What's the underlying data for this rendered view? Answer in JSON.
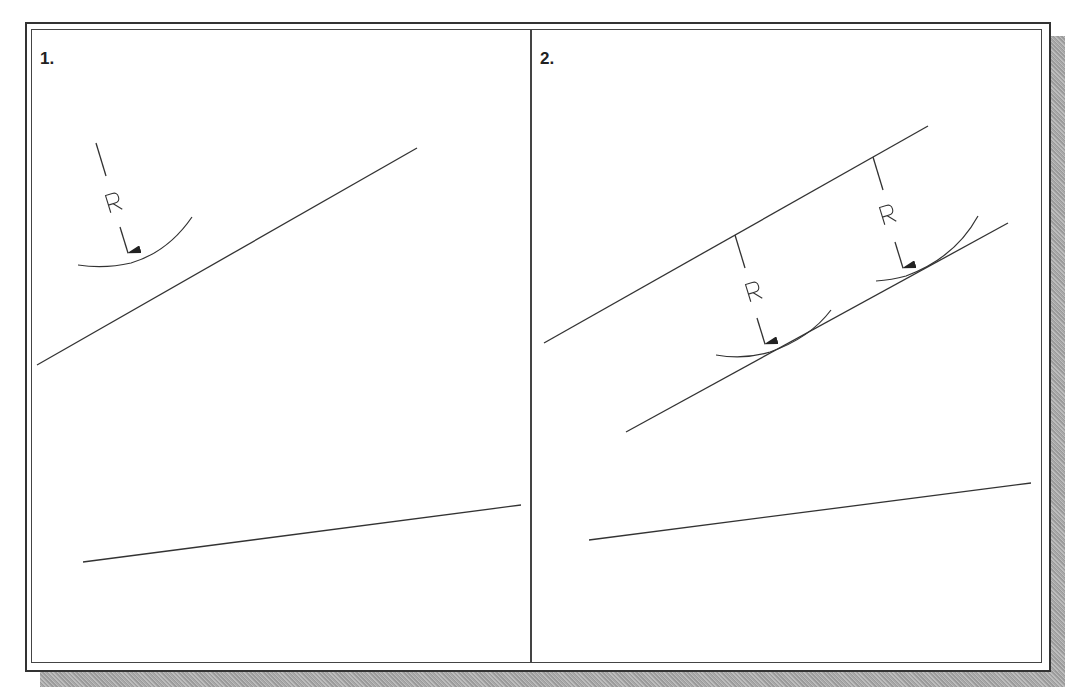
{
  "figure": {
    "panels": [
      {
        "label": "1.",
        "description": "Two non-parallel lines; an arc of radius R is drawn tangent-free above the upper line with a radius dimension arrow",
        "dimension_labels": [
          "R"
        ]
      },
      {
        "label": "2.",
        "description": "Offset line drawn parallel to the upper line at distance R; two arcs of radius R touch the offset line",
        "dimension_labels": [
          "R",
          "R"
        ]
      }
    ],
    "colors": {
      "line": "#333333",
      "frame": "#333333",
      "shadow": "#a8a8a8",
      "background": "#ffffff"
    }
  }
}
